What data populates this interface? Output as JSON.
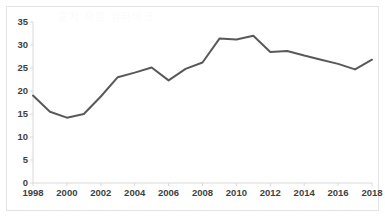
{
  "figure": {
    "background_color": "#ffffff",
    "border_color": "#e3e3e3",
    "watermark_text": "출처 자료 워터마크"
  },
  "chart_data": {
    "type": "line",
    "title": "",
    "subtitle": "",
    "xlabel": "",
    "ylabel": "",
    "x_unit_label": "(년)",
    "grid": false,
    "legend": false,
    "legend_position": "none",
    "line_color": "#595959",
    "line_width": 2,
    "marker": "none",
    "xlim": [
      1998,
      2018
    ],
    "ylim": [
      0,
      35
    ],
    "y_ticks": [
      0,
      5,
      10,
      15,
      20,
      25,
      30,
      35
    ],
    "y_tick_labels": [
      "0",
      "5",
      "10",
      "15",
      "20",
      "25",
      "30",
      "35"
    ],
    "x_ticks": [
      1998,
      2000,
      2002,
      2004,
      2006,
      2008,
      2010,
      2012,
      2014,
      2016,
      2018
    ],
    "x_tick_labels": [
      "1998",
      "2000",
      "2002",
      "2004",
      "2006",
      "2008",
      "2010",
      "2012",
      "2014",
      "2016",
      "2018"
    ],
    "x": [
      1998,
      1999,
      2000,
      2001,
      2002,
      2003,
      2004,
      2005,
      2006,
      2007,
      2008,
      2009,
      2010,
      2011,
      2012,
      2013,
      2014,
      2015,
      2016,
      2017,
      2018
    ],
    "values": [
      19.0,
      15.5,
      14.2,
      15.0,
      18.8,
      23.0,
      24.0,
      25.1,
      22.3,
      24.8,
      26.2,
      31.4,
      31.2,
      32.0,
      28.5,
      28.7,
      27.7,
      26.8,
      25.9,
      24.7,
      26.8
    ]
  }
}
